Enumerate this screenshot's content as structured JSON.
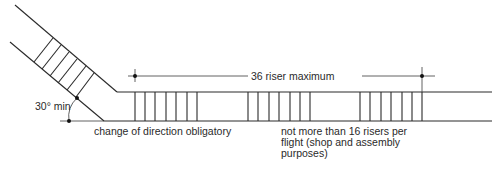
{
  "diagram": {
    "type": "stair plan",
    "labels": {
      "max_risers": "36 riser maximum",
      "angle": "30° min",
      "direction_change": "change of direction obligatory",
      "flight_limit_line1": "not more than 16 risers per",
      "flight_limit_line2": "flight (shop and assembly",
      "flight_limit_line3": "purposes)"
    },
    "flights": [
      {
        "name": "angled-flight",
        "risers": 6
      },
      {
        "name": "first-horizontal-flight",
        "risers": 7
      },
      {
        "name": "middle-flight",
        "risers": 7
      },
      {
        "name": "last-flight",
        "risers": 7
      }
    ],
    "colors": {
      "line": "#2a2a2a",
      "background": "#ffffff"
    }
  }
}
